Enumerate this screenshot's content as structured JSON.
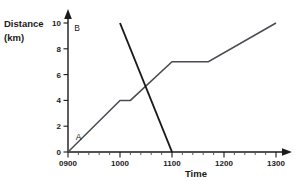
{
  "chart_data": {
    "type": "line",
    "title": "",
    "xlabel": "Time",
    "ylabel_line1": "Distance",
    "ylabel_line2": "(km)",
    "x_tick_labels": [
      "0900",
      "1000",
      "1100",
      "1200",
      "1300"
    ],
    "x_tick_values": [
      900,
      1000,
      1100,
      1200,
      1300
    ],
    "y_tick_labels": [
      "0",
      "2",
      "4",
      "6",
      "8",
      "10"
    ],
    "y_tick_values": [
      0,
      2,
      4,
      6,
      8,
      10
    ],
    "xlim": [
      900,
      1300
    ],
    "ylim": [
      0,
      10
    ],
    "grid": false,
    "legend": "inline-labels",
    "x_minor_ticks_per_interval": 5,
    "series": [
      {
        "name": "A",
        "label": "A",
        "color": "#4a4a52",
        "label_x": 915,
        "label_y": 1.2,
        "points": [
          {
            "x": 900,
            "y": 0
          },
          {
            "x": 1000,
            "y": 4
          },
          {
            "x": 1020,
            "y": 4
          },
          {
            "x": 1100,
            "y": 7
          },
          {
            "x": 1170,
            "y": 7
          },
          {
            "x": 1300,
            "y": 10
          }
        ]
      },
      {
        "name": "B",
        "label": "B",
        "color": "#1a1a1a",
        "label_x": 912,
        "label_y": 9.6,
        "points": [
          {
            "x": 1000,
            "y": 10
          },
          {
            "x": 1100,
            "y": 0
          }
        ]
      }
    ]
  }
}
